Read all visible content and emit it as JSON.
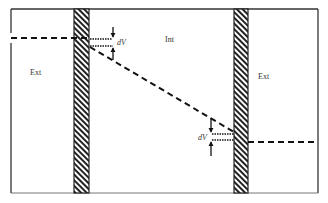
{
  "diagram": {
    "type": "membrane-potential-profile",
    "regions": [
      {
        "id": "left-ext",
        "label": "Ext"
      },
      {
        "id": "interior",
        "label": "Int"
      },
      {
        "id": "right-ext",
        "label": "Ext"
      }
    ],
    "annotations": {
      "top_drop": "dV",
      "bottom_drop": "dV"
    },
    "colors": {
      "line": "#111111",
      "frame": "#333333",
      "wall_hatch": "#222222",
      "background": "#ffffff"
    }
  }
}
